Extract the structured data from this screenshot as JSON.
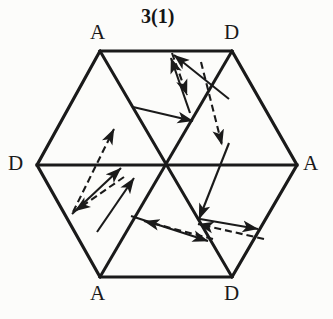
{
  "figure": {
    "title": "3(1)",
    "type": "hexagon-transition-diagram",
    "stroke_color": "#1a1a1a",
    "background_color": "#fcfcfa"
  },
  "hexagon": {
    "center": {
      "x": 166,
      "y": 165
    },
    "vertices": [
      {
        "id": "top-left",
        "label": "A",
        "x": 100,
        "y": 51
      },
      {
        "id": "top-right",
        "label": "D",
        "x": 232,
        "y": 51
      },
      {
        "id": "right",
        "label": "A",
        "x": 297,
        "y": 165
      },
      {
        "id": "bottom-right",
        "label": "D",
        "x": 232,
        "y": 277
      },
      {
        "id": "bottom-left",
        "label": "A",
        "x": 100,
        "y": 277
      },
      {
        "id": "left",
        "label": "D",
        "x": 37,
        "y": 165
      }
    ],
    "diameters": [
      {
        "from": "top-left",
        "to": "bottom-right"
      },
      {
        "from": "top-right",
        "to": "bottom-left"
      },
      {
        "from": "left",
        "to": "right"
      }
    ]
  },
  "labels": {
    "top_left": "A",
    "top_right": "D",
    "left": "D",
    "right": "A",
    "bottom_left": "A",
    "bottom_right": "D"
  },
  "arrows": [
    {
      "id": "arrow-1",
      "style": "dashed",
      "x1": 172,
      "y1": 52,
      "x2": 186,
      "y2": 92,
      "direction": "down"
    },
    {
      "id": "arrow-2",
      "style": "solid",
      "x1": 188,
      "y1": 110,
      "x2": 170,
      "y2": 56,
      "direction": "up"
    },
    {
      "id": "arrow-3",
      "style": "solid",
      "x1": 227,
      "y1": 96,
      "x2": 172,
      "y2": 52,
      "direction": "up-left"
    },
    {
      "id": "arrow-4",
      "style": "dashed",
      "x1": 200,
      "y1": 60,
      "x2": 221,
      "y2": 142,
      "direction": "down-right"
    },
    {
      "id": "arrow-5",
      "style": "solid",
      "x1": 133,
      "y1": 107,
      "x2": 191,
      "y2": 120,
      "direction": "right"
    },
    {
      "id": "arrow-6",
      "style": "dashed",
      "x1": 72,
      "y1": 211,
      "x2": 113,
      "y2": 128,
      "direction": "up-right"
    },
    {
      "id": "arrow-7",
      "style": "solid",
      "x1": 72,
      "y1": 212,
      "x2": 120,
      "y2": 167,
      "direction": "up-right"
    },
    {
      "id": "arrow-8",
      "style": "dashed",
      "x1": 123,
      "y1": 176,
      "x2": 74,
      "y2": 210,
      "direction": "down-left"
    },
    {
      "id": "arrow-9",
      "style": "solid",
      "x1": 96,
      "y1": 230,
      "x2": 133,
      "y2": 177,
      "direction": "up-right"
    },
    {
      "id": "arrow-10",
      "style": "solid",
      "x1": 228,
      "y1": 142,
      "x2": 198,
      "y2": 216,
      "direction": "down-left"
    },
    {
      "id": "arrow-11",
      "style": "solid",
      "x1": 200,
      "y1": 219,
      "x2": 256,
      "y2": 228,
      "direction": "right"
    },
    {
      "id": "arrow-12",
      "style": "dashed",
      "x1": 262,
      "y1": 238,
      "x2": 197,
      "y2": 223,
      "direction": "left"
    },
    {
      "id": "arrow-13",
      "style": "dashed",
      "x1": 211,
      "y1": 238,
      "x2": 143,
      "y2": 220,
      "direction": "left"
    },
    {
      "id": "arrow-14",
      "style": "solid",
      "x1": 131,
      "y1": 216,
      "x2": 206,
      "y2": 240,
      "direction": "right"
    }
  ]
}
